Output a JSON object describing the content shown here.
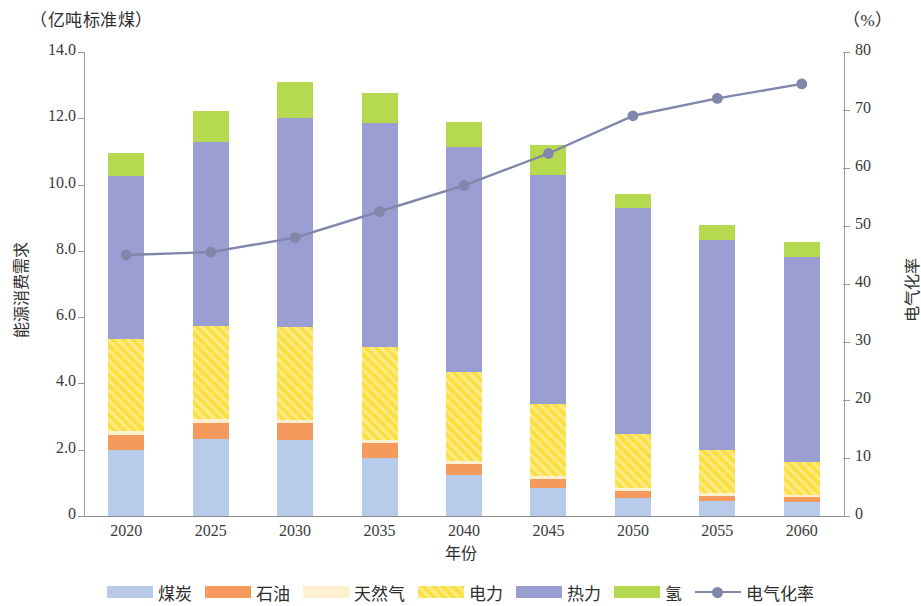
{
  "chart_data": {
    "type": "bar",
    "title": "",
    "subtitle": "",
    "stacked": true,
    "categories": [
      "2020",
      "2025",
      "2030",
      "2035",
      "2040",
      "2045",
      "2050",
      "2055",
      "2060"
    ],
    "xlabel": "年份",
    "ylabel": "能源消费需求",
    "y_unit": "（亿吨标准煤）",
    "ylim": [
      0,
      14
    ],
    "yticks": [
      "0",
      "2.0",
      "4.0",
      "6.0",
      "8.0",
      "10.0",
      "12.0",
      "14.0"
    ],
    "y2label": "电气化率",
    "y2_unit": "（%）",
    "y2lim": [
      0,
      80
    ],
    "y2ticks": [
      "0",
      "10",
      "20",
      "30",
      "40",
      "50",
      "60",
      "70",
      "80"
    ],
    "grid": false,
    "legend_position": "bottom",
    "series": [
      {
        "name": "煤炭",
        "key": "coal",
        "color": "#b9cbea",
        "values": [
          2.0,
          2.32,
          2.3,
          1.75,
          1.25,
          0.85,
          0.55,
          0.45,
          0.42
        ]
      },
      {
        "name": "石油",
        "key": "oil",
        "color": "#f6995c",
        "values": [
          0.45,
          0.5,
          0.5,
          0.45,
          0.32,
          0.26,
          0.2,
          0.16,
          0.14
        ]
      },
      {
        "name": "天然气",
        "key": "gas",
        "color": "#fdf0d0",
        "values": [
          0.1,
          0.1,
          0.1,
          0.1,
          0.1,
          0.1,
          0.08,
          0.07,
          0.06
        ]
      },
      {
        "name": "电力",
        "key": "power",
        "color": "#fcdf43",
        "values": [
          2.8,
          2.8,
          2.8,
          2.8,
          2.66,
          2.17,
          1.65,
          1.3,
          1.0
        ]
      },
      {
        "name": "热力",
        "key": "heat",
        "color": "#9a9ed2",
        "values": [
          4.9,
          5.55,
          6.3,
          6.75,
          6.8,
          6.9,
          6.8,
          6.35,
          6.2
        ]
      },
      {
        "name": "氢",
        "key": "hydrogen",
        "color": "#b5d94f",
        "values": [
          0.7,
          0.95,
          1.1,
          0.9,
          0.75,
          0.9,
          0.45,
          0.45,
          0.45
        ]
      }
    ],
    "stack_order": [
      "煤炭",
      "石油",
      "天然气",
      "电力",
      "热力",
      "氢"
    ],
    "totals": [
      10.95,
      12.22,
      13.1,
      12.75,
      11.88,
      11.18,
      9.73,
      8.78,
      8.27
    ],
    "line_series": {
      "name": "电气化率",
      "color": "#8186ab",
      "axis": "right",
      "values": [
        45.0,
        45.5,
        48.0,
        52.5,
        57.0,
        62.5,
        69.0,
        72.0,
        74.5
      ]
    }
  },
  "legend": {
    "items": [
      {
        "label": "煤炭",
        "type": "swatch",
        "color": "#b9cbea"
      },
      {
        "label": "石油",
        "type": "swatch",
        "color": "#f6995c"
      },
      {
        "label": "天然气",
        "type": "swatch",
        "color": "#fdf0d0"
      },
      {
        "label": "电力",
        "type": "swatch",
        "color": "#fcdf43"
      },
      {
        "label": "热力",
        "type": "swatch",
        "color": "#9a9ed2"
      },
      {
        "label": "氢",
        "type": "swatch",
        "color": "#b5d94f"
      },
      {
        "label": "电气化率",
        "type": "line",
        "color": "#8186ab"
      }
    ]
  }
}
